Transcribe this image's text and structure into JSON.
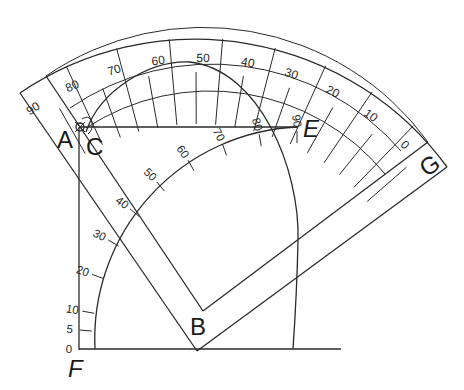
{
  "diagram": {
    "points": {
      "A": "A",
      "B": "B",
      "C": "C",
      "E": "E",
      "F": "F",
      "G": "G"
    },
    "protractor_ring_labels": [
      "90",
      "80",
      "70",
      "60",
      "50",
      "40",
      "30",
      "20",
      "10",
      "0"
    ],
    "quarter_arc_scale_labels": [
      "0",
      "5",
      "10",
      "20",
      "30",
      "40",
      "50",
      "60",
      "70",
      "80",
      "90"
    ],
    "colors": {
      "line": "#2a2a2a",
      "background": "#ffffff"
    }
  }
}
